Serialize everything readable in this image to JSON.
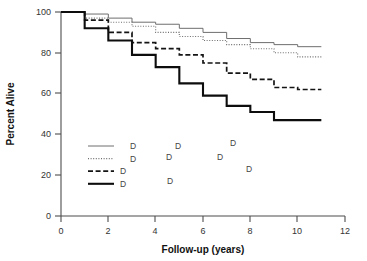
{
  "chart_data": {
    "type": "line",
    "title": "",
    "xlabel": "Follow-up (years)",
    "ylabel": "Percent Alive",
    "xlim": [
      0,
      12
    ],
    "ylim": [
      0,
      100
    ],
    "xticks": [
      0,
      2,
      4,
      6,
      8,
      10,
      12
    ],
    "yticks": [
      0,
      20,
      40,
      60,
      80,
      100
    ],
    "xtick_labels": [
      "0",
      "2",
      "4",
      "6",
      "8",
      "10",
      "12"
    ],
    "ytick_labels": [
      "0",
      "20",
      "40",
      "60",
      "80",
      "100"
    ],
    "grid": false,
    "legend_position": "lower-left-inside",
    "series": [
      {
        "name": "series-1",
        "style": "solid-thin",
        "color": "#6e6e6e",
        "x": [
          0,
          1,
          1,
          2,
          2,
          3,
          3,
          4,
          4,
          5,
          5,
          6,
          6,
          7,
          7,
          8,
          8,
          9,
          9,
          10,
          10,
          11
        ],
        "y": [
          100,
          100,
          99,
          99,
          97,
          97,
          95,
          95,
          94,
          94,
          92,
          92,
          90,
          90,
          87,
          87,
          85,
          85,
          84,
          84,
          83,
          83
        ]
      },
      {
        "name": "series-2",
        "style": "dotted",
        "color": "#6e6e6e",
        "x": [
          0,
          1,
          1,
          2,
          2,
          3,
          3,
          4,
          4,
          5,
          5,
          6,
          6,
          7,
          7,
          8,
          8,
          9,
          9,
          10,
          10,
          11
        ],
        "y": [
          100,
          100,
          97,
          97,
          95,
          95,
          93,
          93,
          90,
          90,
          88,
          88,
          86,
          86,
          84,
          84,
          82,
          82,
          80,
          80,
          78,
          78
        ]
      },
      {
        "name": "series-3",
        "style": "dashed",
        "color": "#141414",
        "x": [
          0,
          1,
          1,
          2,
          2,
          3,
          3,
          4,
          4,
          5,
          5,
          6,
          6,
          7,
          7,
          8,
          8,
          9,
          9,
          10,
          10,
          11
        ],
        "y": [
          100,
          100,
          96,
          96,
          90,
          90,
          85,
          85,
          82,
          82,
          79,
          79,
          75,
          75,
          70,
          70,
          67,
          67,
          63,
          63,
          62,
          62
        ]
      },
      {
        "name": "series-4",
        "style": "solid-bold",
        "color": "#0d0d0d",
        "x": [
          0,
          1,
          1,
          2,
          2,
          3,
          3,
          4,
          4,
          5,
          5,
          6,
          6,
          7,
          7,
          8,
          8,
          9,
          9,
          10,
          10,
          11
        ],
        "y": [
          100,
          100,
          92,
          92,
          86,
          86,
          79,
          79,
          73,
          73,
          65,
          65,
          59,
          59,
          54,
          54,
          51,
          51,
          47,
          47,
          47,
          47
        ]
      }
    ],
    "legend_entries": [
      {
        "style": "solid-thin",
        "label": "D"
      },
      {
        "style": "dotted",
        "label": "D"
      },
      {
        "style": "dashed",
        "label": "D"
      },
      {
        "style": "solid-bold",
        "label": "D"
      }
    ],
    "stray_labels": [
      {
        "label": "D",
        "x_px": 175,
        "y_px": 149
      },
      {
        "label": "D",
        "x_px": 230,
        "y_px": 146
      },
      {
        "label": "D",
        "x_px": 166,
        "y_px": 160
      },
      {
        "label": "D",
        "x_px": 217,
        "y_px": 160
      },
      {
        "label": "D",
        "x_px": 246,
        "y_px": 172
      },
      {
        "label": "D",
        "x_px": 167,
        "y_px": 184
      }
    ]
  }
}
